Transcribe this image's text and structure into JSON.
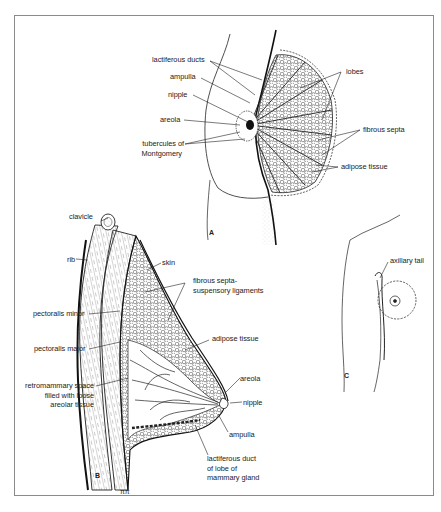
{
  "figure": {
    "panels": [
      {
        "id": "A",
        "label": "A",
        "description": "Frontal view of breast with partial cutaway",
        "labels": {
          "lactiferous_ducts": "lactiferous ducts",
          "ampulla": "ampulla",
          "nipple": "nipple",
          "areola": "areola",
          "tubercules_1": "tubercules of",
          "tubercules_2": "Montgomery",
          "lobes": "lobes",
          "fibrous_septa": "fibrous septa",
          "adipose_tissue": "adipose tissue"
        }
      },
      {
        "id": "B",
        "label": "B",
        "description": "Sagittal section of breast and chest wall",
        "labels": {
          "clavicle": "clavicle",
          "rib": "rib",
          "skin": "skin",
          "fibrous_1": "fibrous septa-",
          "fibrous_2": "suspensory ligaments",
          "pectoralis_minor": "pectoralis minor",
          "pectoralis_major": "pectoralis major",
          "adipose_tissue": "adipose tissue",
          "retro_1": "retromammary space",
          "retro_2": "filled with loose",
          "retro_3": "areolar tissue",
          "areola": "areola",
          "nipple": "nipple",
          "ampulla": "ampulla",
          "duct_1": "lactiferous duct",
          "duct_2": "of lobe of",
          "duct_3": "mammary gland"
        }
      },
      {
        "id": "C",
        "label": "C",
        "description": "Outline showing axillary tail",
        "labels": {
          "axillary_tail": "axillary tail"
        }
      }
    ],
    "colors": {
      "ink": "#222222",
      "frame": "#8a8a8a",
      "background": "#ffffff"
    }
  }
}
